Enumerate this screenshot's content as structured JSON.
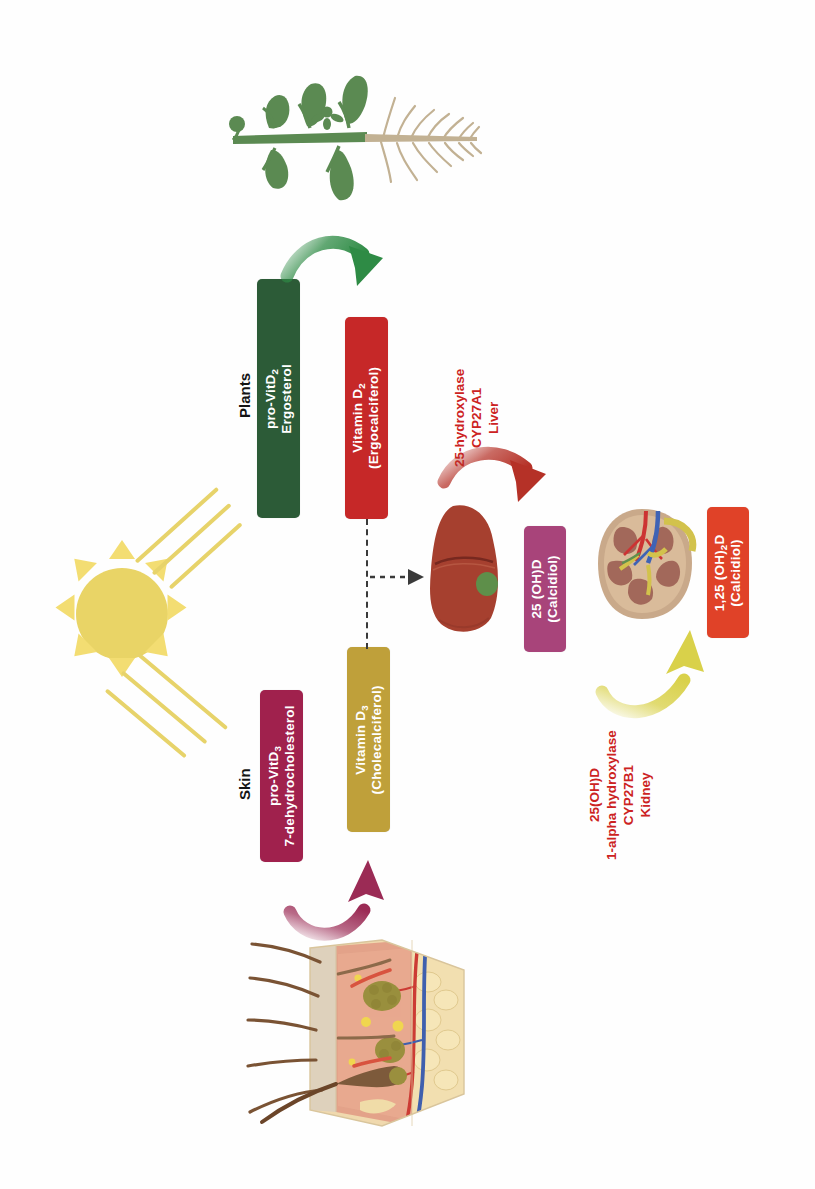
{
  "figure": {
    "orientation": "rotated-90-ccw",
    "background": "#ffffff"
  },
  "sources": {
    "plants_label": "Plants",
    "skin_label": "Skin"
  },
  "nodes": {
    "pro_vit_d2": {
      "line1_pre": "pro-VitD",
      "line1_sub": "2",
      "line2": "Ergosterol",
      "color": "#2c5b37"
    },
    "vitamin_d2": {
      "line1_pre": "Vitamin D",
      "line1_sub": "2",
      "line2": "(Ergocalciferol)",
      "color": "#c62828"
    },
    "pro_vit_d3": {
      "line1_pre": "pro-VitD",
      "line1_sub": "3",
      "line2": "7-dehydrocholesterol",
      "color": "#a0214d"
    },
    "vitamin_d3": {
      "line1_pre": "Vitamin D",
      "line1_sub": "3",
      "line2": "(Cholecalciferol)",
      "color": "#bfa03a"
    },
    "calcidiol": {
      "line1_pre": "25 (OH)D",
      "line1_sub": "",
      "line2": "(Calcidiol)",
      "color": "#a8447a"
    },
    "calcitriol": {
      "line1_pre": "1,25 (OH)",
      "line1_sub": "2",
      "line1_post": "D",
      "line2": "(Calcidiol)",
      "color": "#e04228"
    }
  },
  "enzymes": {
    "liver_step": {
      "line1": "25-hydroxylase",
      "line2": "CYP27A1",
      "line3": "Liver",
      "color": "#cc2222"
    },
    "kidney_step": {
      "line1": "25(OH)D",
      "line2": "1-alpha hydroxylase",
      "line3": "CYP27B1",
      "line4": "Kidney",
      "color": "#cc2222"
    }
  },
  "illustrations": {
    "plant": "plant-illustration",
    "sun": "sun-illustration",
    "skin": "skin-cross-section-illustration",
    "liver": "liver-illustration",
    "kidney": "kidney-illustration"
  },
  "arrows": {
    "plant_to_d2": {
      "name": "green-arrow",
      "color": "#2e8b45"
    },
    "skin_to_d3": {
      "name": "magenta-arrow",
      "color": "#9b2b55"
    },
    "liver_arrow": {
      "name": "dark-red-arrow",
      "color": "#b53127"
    },
    "kidney_arrow": {
      "name": "yellow-arrow",
      "color": "#d9d14a"
    },
    "d2_to_d3_dashed": {
      "name": "dashed-connector",
      "color": "#3a3a3a"
    }
  },
  "palette": {
    "green_box": "#2c5b37",
    "red_box": "#c62828",
    "magenta_box": "#a0214d",
    "gold_box": "#bfa03a",
    "purple_box": "#a8447a",
    "orange_box": "#e04228",
    "sun_yellow": "#e9d466",
    "enzyme_red": "#cc2222"
  }
}
